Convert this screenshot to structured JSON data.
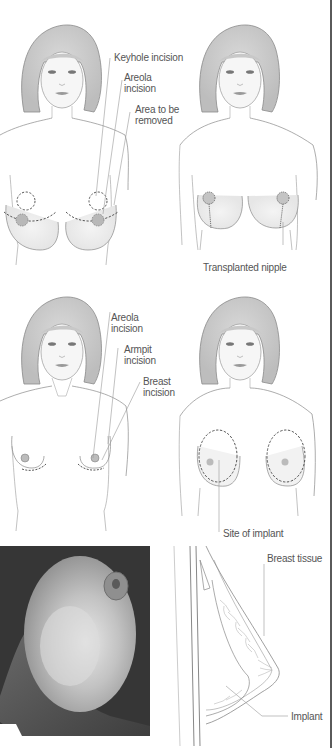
{
  "figure": {
    "panels": [
      {
        "id": "breast-reduction-before",
        "labels": [
          "Keyhole incision",
          "Areola incision",
          "Area to be removed"
        ]
      },
      {
        "id": "breast-reduction-after",
        "labels": [
          "Transplanted nipple"
        ]
      },
      {
        "id": "breast-augmentation-incisions",
        "labels": [
          "Areola incision",
          "Armpit incision",
          "Breast incision"
        ]
      },
      {
        "id": "breast-augmentation-implant-site",
        "labels": [
          "Site of implant"
        ]
      },
      {
        "id": "implant-photo",
        "labels": []
      },
      {
        "id": "implant-cross-section",
        "labels": [
          "Breast tissue",
          "Implant"
        ]
      }
    ]
  },
  "labels": {
    "keyhole_incision": "Keyhole incision",
    "areola_incision_1a": "Areola",
    "areola_incision_1b": "incision",
    "area_removed_a": "Area to be",
    "area_removed_b": "removed",
    "transplanted_nipple": "Transplanted nipple",
    "areola_incision_2a": "Areola",
    "areola_incision_2b": "incision",
    "armpit_incision_a": "Armpit",
    "armpit_incision_b": "incision",
    "breast_incision_a": "Breast",
    "breast_incision_b": "incision",
    "site_of_implant": "Site of implant",
    "breast_tissue": "Breast tissue",
    "implant": "Implant"
  },
  "colors": {
    "line": "#8a8a8a",
    "dashed": "#444444",
    "text": "#555555",
    "border": "#5a5a5a",
    "photo_bg": "#3a3a3a"
  }
}
